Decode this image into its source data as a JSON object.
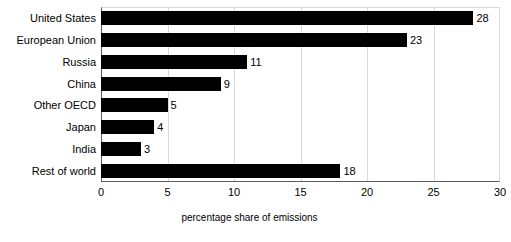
{
  "chart_data": {
    "type": "bar",
    "orientation": "horizontal",
    "title": "",
    "xlabel": "percentage share of emissions",
    "ylabel": "",
    "categories": [
      "United States",
      "European Union",
      "Russia",
      "China",
      "Other OECD",
      "Japan",
      "India",
      "Rest of world"
    ],
    "values": [
      28,
      23,
      11,
      9,
      5,
      4,
      3,
      18
    ],
    "data_labels": [
      "28",
      "23",
      "11",
      "9",
      "5",
      "4",
      "3",
      "18"
    ],
    "xlim": [
      0,
      30
    ],
    "xticks": [
      0,
      5,
      10,
      15,
      20,
      25,
      30
    ],
    "xtick_labels": [
      "0",
      "5",
      "10",
      "15",
      "20",
      "25",
      "30"
    ],
    "grid": "vertical",
    "legend": "none",
    "bar_color": "#000000",
    "gridline_color": "#d9d9d9",
    "axis_color": "#5a5a5a",
    "background_color": "#ffffff"
  }
}
